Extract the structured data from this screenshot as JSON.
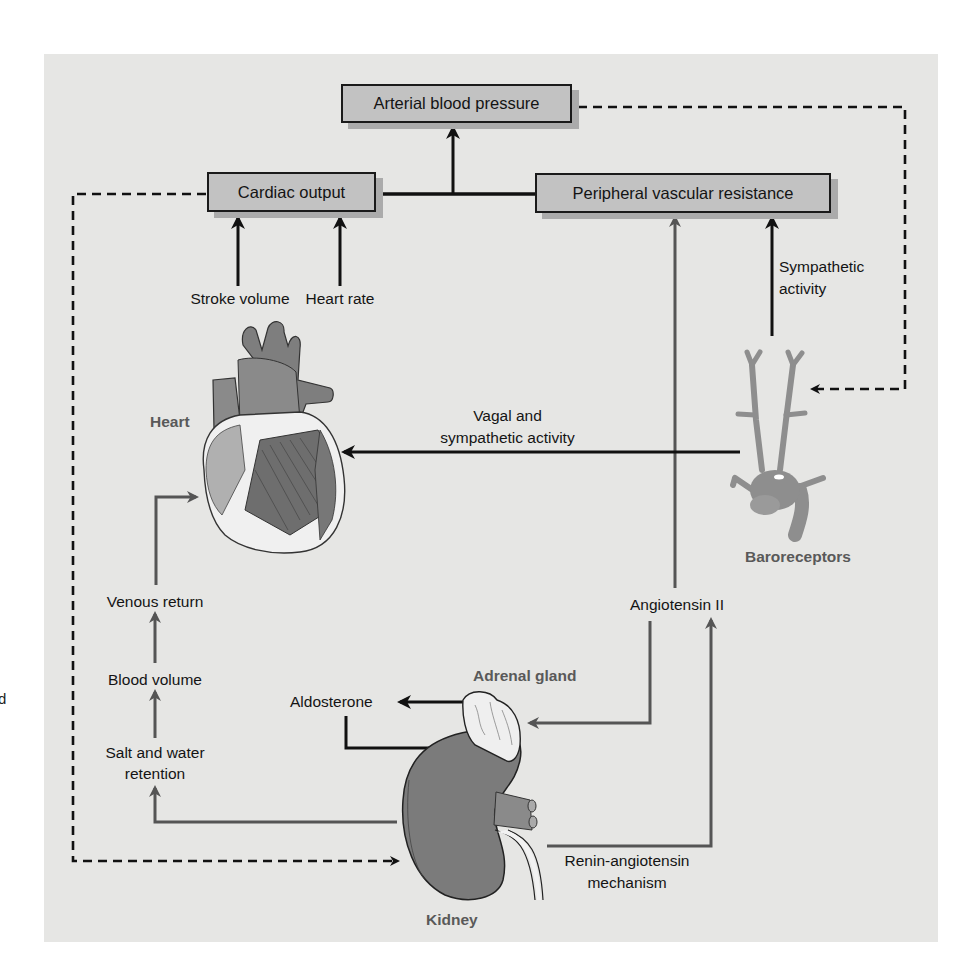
{
  "boxes": {
    "arterial_bp": "Arterial blood pressure",
    "cardiac_output": "Cardiac output",
    "pvr": "Peripheral vascular resistance"
  },
  "labels": {
    "stroke_volume": "Stroke volume",
    "heart_rate": "Heart rate",
    "sympathetic_line1": "Sympathetic",
    "sympathetic_line2": "activity",
    "vagal_line1": "Vagal and",
    "vagal_line2": "sympathetic activity",
    "venous_return": "Venous return",
    "blood_volume": "Blood volume",
    "salt_water_line1": "Salt and water",
    "salt_water_line2": "retention",
    "aldosterone": "Aldosterone",
    "angiotensin_ii": "Angiotensin II",
    "renin_line1": "Renin-angiotensin",
    "renin_line2": "mechanism",
    "stray_edge_char": "d"
  },
  "organs": {
    "heart": "Heart",
    "baroreceptors": "Baroreceptors",
    "adrenal_gland": "Adrenal gland",
    "kidney": "Kidney"
  },
  "colors": {
    "panel_bg": "#e6e6e4",
    "box_fill": "#c2c2c2",
    "black_arrow": "#111111",
    "gray_arrow": "#555555",
    "organ_label": "#595959"
  }
}
